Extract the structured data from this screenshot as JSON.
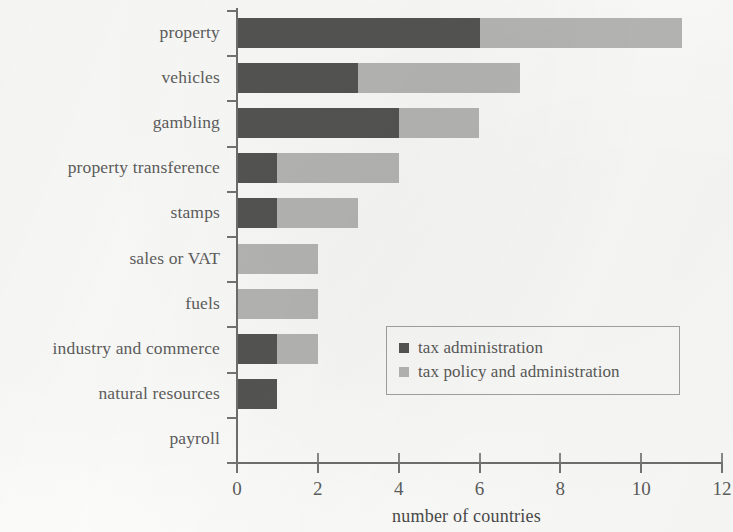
{
  "chart_data": {
    "type": "bar",
    "orientation": "horizontal",
    "stacked": true,
    "title": "",
    "xlabel": "number of countries",
    "ylabel": "",
    "xlim": [
      0,
      12
    ],
    "xticks": [
      "0",
      "2",
      "4",
      "6",
      "8",
      "10",
      "12"
    ],
    "xtick_values": [
      0,
      2,
      4,
      6,
      8,
      10,
      12
    ],
    "grid": false,
    "legend_position": "center-right-inside",
    "categories": [
      "property",
      "vehicles",
      "gambling",
      "property transference",
      "stamps",
      "sales or VAT",
      "fuels",
      "industry and commerce",
      "natural resources",
      "payroll"
    ],
    "series": [
      {
        "name": "tax administration",
        "color": "#555553",
        "values": [
          6,
          3,
          4,
          1,
          1,
          0,
          0,
          1,
          1,
          0
        ]
      },
      {
        "name": "tax policy and administration",
        "color": "#b7b7b5",
        "values": [
          5,
          4,
          2,
          3,
          2,
          2,
          2,
          1,
          0,
          0
        ]
      }
    ],
    "totals": [
      11,
      7,
      6,
      4,
      3,
      2,
      2,
      2,
      1,
      0
    ]
  },
  "legend": {
    "entries": [
      {
        "label": "tax administration",
        "swatch": "legend-swatch-dark"
      },
      {
        "label": "tax policy and administration",
        "swatch": "legend-swatch-light"
      }
    ]
  },
  "colors": {
    "series_dark": "#555553",
    "series_light": "#b7b7b5",
    "axis": "#6f6f6d",
    "text": "#5e5e5c",
    "background": "#fdfdfc"
  }
}
